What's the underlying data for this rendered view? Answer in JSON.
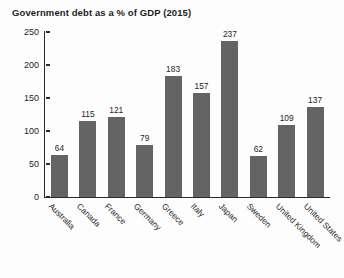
{
  "chart_data": {
    "type": "bar",
    "title": "Government debt as a % of GDP (2015)",
    "xlabel": "",
    "ylabel": "",
    "ylim": [
      0,
      250
    ],
    "yticks": [
      0,
      50,
      100,
      150,
      200,
      250
    ],
    "grid": false,
    "legend": null,
    "bar_color": "#646464",
    "axis_color": "#2b2b2b",
    "background_color": "#fdfdfd",
    "show_value_labels": true,
    "categories": [
      "Australia",
      "Canada",
      "France",
      "Germany",
      "Greece",
      "Italy",
      "Japan",
      "Sweden",
      "United Kingdom",
      "United States"
    ],
    "values": [
      64,
      115,
      121,
      79,
      183,
      157,
      237,
      62,
      109,
      137
    ]
  }
}
